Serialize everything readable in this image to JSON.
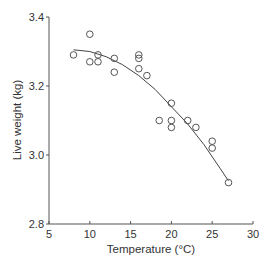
{
  "chart_data": {
    "type": "scatter",
    "title": "",
    "xlabel": "Temperature (°C)",
    "ylabel": "Live weight (kg)",
    "xlim": [
      5,
      30
    ],
    "ylim": [
      2.8,
      3.4
    ],
    "xticks": [
      5,
      10,
      15,
      20,
      25,
      30
    ],
    "yticks": [
      2.8,
      3.0,
      3.2,
      3.4
    ],
    "ytick_labels": [
      "2.8",
      "3.0",
      "3.2",
      "3.4"
    ],
    "grid": false,
    "legend": null,
    "series": [
      {
        "name": "observations",
        "marker": "open-circle",
        "points": [
          [
            8,
            3.29
          ],
          [
            10,
            3.35
          ],
          [
            10,
            3.27
          ],
          [
            11,
            3.29
          ],
          [
            11,
            3.27
          ],
          [
            13,
            3.28
          ],
          [
            13,
            3.24
          ],
          [
            16,
            3.29
          ],
          [
            16,
            3.28
          ],
          [
            16,
            3.25
          ],
          [
            17,
            3.23
          ],
          [
            18.5,
            3.1
          ],
          [
            20,
            3.15
          ],
          [
            20,
            3.1
          ],
          [
            20,
            3.08
          ],
          [
            22,
            3.1
          ],
          [
            23,
            3.08
          ],
          [
            25,
            3.04
          ],
          [
            25,
            3.02
          ],
          [
            27,
            2.92
          ]
        ]
      },
      {
        "name": "quadratic fit",
        "style": "line",
        "points": [
          [
            8,
            3.305
          ],
          [
            10,
            3.3
          ],
          [
            12,
            3.285
          ],
          [
            14,
            3.262
          ],
          [
            16,
            3.23
          ],
          [
            18,
            3.19
          ],
          [
            20,
            3.14
          ],
          [
            22,
            3.09
          ],
          [
            24,
            3.03
          ],
          [
            26,
            2.96
          ],
          [
            27,
            2.925
          ]
        ]
      }
    ]
  }
}
